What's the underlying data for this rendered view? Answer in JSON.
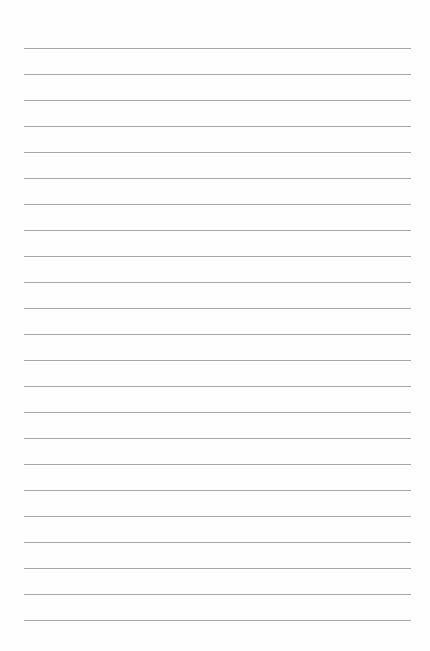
{
  "page": {
    "type": "lined-paper",
    "background": "#fefefe",
    "line_color": "#9a9a9a",
    "line_count": 23,
    "first_line_y": 48,
    "line_spacing": 26,
    "line_left": 24,
    "line_width": 387
  }
}
